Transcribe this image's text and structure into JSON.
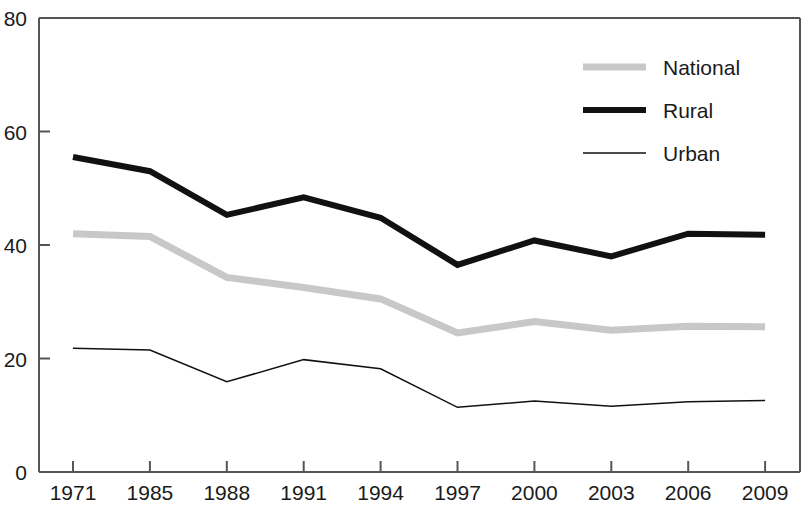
{
  "chart_data": {
    "type": "line",
    "title": "",
    "subtitle": "",
    "xlabel": "",
    "ylabel": "",
    "categories": [
      "1971",
      "1985",
      "1988",
      "1991",
      "1994",
      "1997",
      "2000",
      "2003",
      "2006",
      "2009"
    ],
    "series": [
      {
        "name": "National",
        "color": "#c8c8c8",
        "line_width": 7,
        "values": [
          42.0,
          41.5,
          34.3,
          32.5,
          30.5,
          24.5,
          26.5,
          25.0,
          25.7,
          25.6
        ]
      },
      {
        "name": "Rural",
        "color": "#111111",
        "line_width": 6,
        "values": [
          55.5,
          53.0,
          45.3,
          48.4,
          44.8,
          36.5,
          40.8,
          38.0,
          42.0,
          41.8
        ]
      },
      {
        "name": "Urban",
        "color": "#111111",
        "line_width": 1.5,
        "values": [
          21.8,
          21.5,
          15.9,
          19.8,
          18.2,
          11.4,
          12.5,
          11.6,
          12.4,
          12.6
        ]
      }
    ],
    "ylim": [
      0,
      80
    ],
    "yticks": [
      0,
      20,
      40,
      60,
      80
    ],
    "ytick_labels": [
      "0",
      "20",
      "40",
      "60",
      "80"
    ],
    "grid": false,
    "legend_position": "top-right",
    "legend_entries": [
      "National",
      "Rural",
      "Urban"
    ],
    "axis_color": "#555555"
  }
}
